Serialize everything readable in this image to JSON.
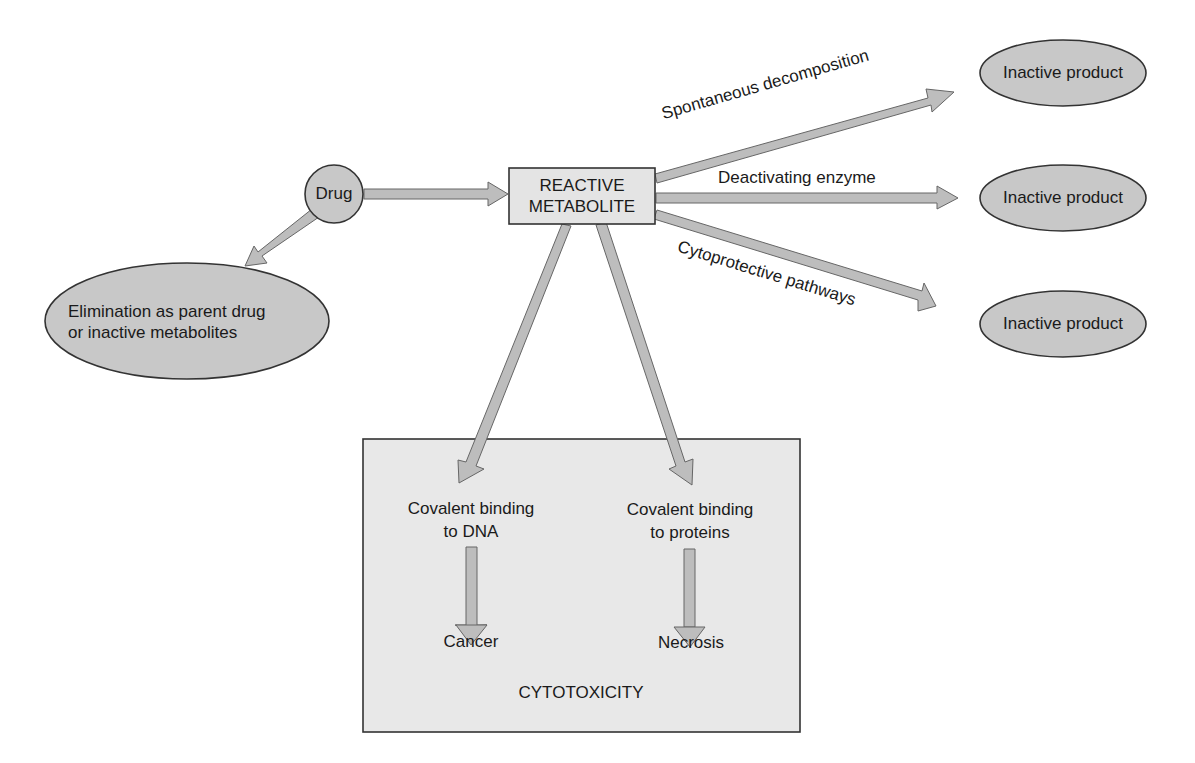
{
  "nodes": {
    "drug": {
      "label": "Drug"
    },
    "reactive_metabolite": {
      "line1": "REACTIVE",
      "line2": "METABOLITE"
    },
    "elimination": {
      "line1": "Elimination as parent drug",
      "line2": "or inactive metabolites"
    },
    "inactive_products": [
      {
        "label": "Inactive product"
      },
      {
        "label": "Inactive product"
      },
      {
        "label": "Inactive product"
      }
    ],
    "cytotoxicity_box": {
      "title": "CYTOTOXICITY",
      "dna_binding": {
        "line1": "Covalent binding",
        "line2": "to DNA"
      },
      "protein_binding": {
        "line1": "Covalent binding",
        "line2": "to proteins"
      },
      "cancer": "Cancer",
      "necrosis": "Necrosis"
    }
  },
  "edges": {
    "spontaneous": "Spontaneous decomposition",
    "deactivating": "Deactivating enzyme",
    "cytoprotective": "Cytoprotective pathways"
  },
  "colors": {
    "node_fill": "#c8c8c8",
    "box_fill": "#e6e6e6",
    "arrow_fill": "#bdbdbd",
    "stroke": "#333333"
  }
}
